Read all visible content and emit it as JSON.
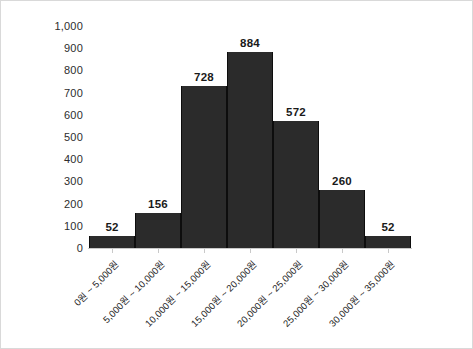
{
  "chart_data": {
    "type": "bar",
    "title": "",
    "subtitle": "",
    "xlabel": "",
    "ylabel": "",
    "grid": false,
    "legend": false,
    "legend_position": "none",
    "ylim": [
      0,
      1000
    ],
    "ytick_step": 100,
    "categories": [
      "0원 ~ 5,000원",
      "5,000원 ~ 10,000원",
      "10,000원 ~ 15,000원",
      "15,000원 ~ 20,000원",
      "20,000원 ~ 25,000원",
      "25,000원 ~ 30,000원",
      "30,000원 ~ 35,000원"
    ],
    "values": [
      52,
      156,
      728,
      884,
      572,
      260,
      52
    ],
    "data_labels": [
      "52",
      "156",
      "728",
      "884",
      "572",
      "260",
      "52"
    ],
    "ytick_labels": [
      "1,000",
      "900",
      "800",
      "700",
      "600",
      "500",
      "400",
      "300",
      "200",
      "100",
      "0"
    ],
    "ytick_values": [
      1000,
      900,
      800,
      700,
      600,
      500,
      400,
      300,
      200,
      100,
      0
    ],
    "bar_color": "#2b2b2b",
    "bar_edge_color": "#0d0d0d",
    "axis_color": "#c9c9c9",
    "frame_color": "#d9d9d9",
    "text_color": "#262626",
    "background": "#ffffff"
  }
}
